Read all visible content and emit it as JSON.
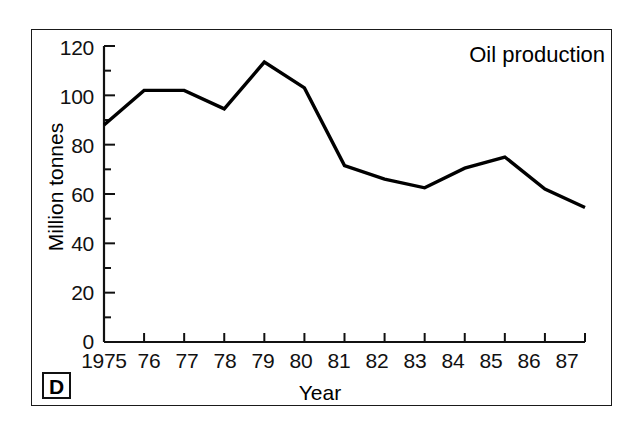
{
  "figure": {
    "panel_label": "D",
    "background_color": "#ffffff",
    "line_color": "#000000",
    "frame_color": "#1a1a1a"
  },
  "chart_data": {
    "type": "line",
    "title": "Oil production",
    "xlabel": "Year",
    "ylabel": "Million tonnes",
    "grid": false,
    "legend": "none",
    "xlim": [
      1975,
      1987
    ],
    "ylim": [
      0,
      120
    ],
    "y_major_ticks": [
      0,
      20,
      40,
      60,
      80,
      100,
      120
    ],
    "y_minor_tick_interval": 10,
    "y_tick_labels": [
      "0",
      "20",
      "40",
      "60",
      "80",
      "100",
      "120"
    ],
    "x_tick_labels": [
      "1975",
      "76",
      "77",
      "78",
      "79",
      "80",
      "81",
      "82",
      "83",
      "84",
      "85",
      "86",
      "87"
    ],
    "categories": [
      1975,
      1976,
      1977,
      1978,
      1979,
      1980,
      1981,
      1982,
      1983,
      1984,
      1985,
      1986,
      1987
    ],
    "values": [
      88,
      102,
      102,
      94.5,
      113.5,
      103,
      71.5,
      66,
      62.5,
      70.5,
      75,
      62,
      54.5
    ],
    "series": [
      {
        "name": "Oil production",
        "values": [
          88,
          102,
          102,
          94.5,
          113.5,
          103,
          71.5,
          66,
          62.5,
          70.5,
          75,
          62,
          54.5
        ]
      }
    ],
    "annotations": [
      "D"
    ]
  }
}
